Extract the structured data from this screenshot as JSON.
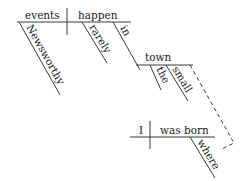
{
  "diagram": {
    "type": "sentence-diagram",
    "main_clause": {
      "subject": "events",
      "predicate": "happen",
      "subject_modifiers": [
        "Newsworthy"
      ],
      "predicate_modifiers": [
        "rarely",
        "in"
      ],
      "prepositional_object": "town",
      "object_modifiers": [
        "the",
        "small"
      ]
    },
    "relative_clause": {
      "subject": "I",
      "predicate": "was born",
      "modifiers": [
        "where"
      ]
    },
    "line_color": "#3a3a3a",
    "text_color": "#1a1a1a"
  }
}
